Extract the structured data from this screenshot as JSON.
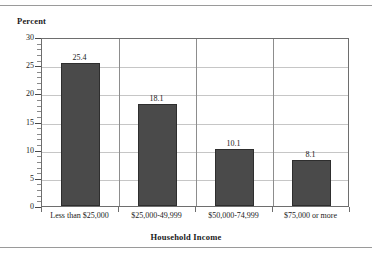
{
  "chart_data": {
    "type": "bar",
    "title": "",
    "xlabel": "Household Income",
    "ylabel": "Percent",
    "categories": [
      "Less than $25,000",
      "$25,000-49,999",
      "$50,000-74,999",
      "$75,000 or more"
    ],
    "values": [
      25.4,
      18.1,
      10.1,
      8.1
    ],
    "value_labels": [
      "25.4",
      "18.1",
      "10.1",
      "8.1"
    ],
    "ylim": [
      0,
      30
    ],
    "ytick_labels": [
      "0",
      "5",
      "10",
      "15",
      "20",
      "25",
      "30"
    ],
    "ytick_values": [
      0,
      5,
      10,
      15,
      20,
      25,
      30
    ],
    "minor_tick_step": 1,
    "grid": "both",
    "legend": "none",
    "bar_color": "#4a4a4a",
    "bar_edge_color": "#2e2e2e",
    "gridline_color": "#c6c6c6",
    "frame_color": "#6e6e6e",
    "text_color": "#1a1a1a",
    "background": "#ffffff"
  }
}
